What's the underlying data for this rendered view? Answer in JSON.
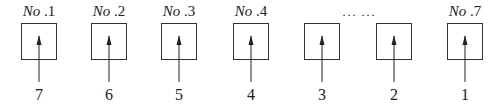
{
  "diagram": {
    "boxes": [
      {
        "title_prefix": "No",
        "title_num": ".1",
        "arrow_label": "7",
        "x": 21
      },
      {
        "title_prefix": "No",
        "title_num": ".2",
        "arrow_label": "6",
        "x": 91
      },
      {
        "title_prefix": "No",
        "title_num": ".3",
        "arrow_label": "5",
        "x": 161
      },
      {
        "title_prefix": "No",
        "title_num": ".4",
        "arrow_label": "4",
        "x": 233
      },
      {
        "title_prefix": "",
        "title_num": "",
        "arrow_label": "3",
        "x": 304
      },
      {
        "title_prefix": "",
        "title_num": "",
        "arrow_label": "2",
        "x": 376
      },
      {
        "title_prefix": "No",
        "title_num": ".7",
        "arrow_label": "1",
        "x": 447
      }
    ],
    "ellipsis": "··· ···"
  }
}
